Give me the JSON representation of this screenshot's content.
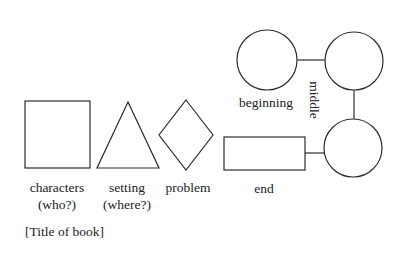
{
  "diagram": {
    "title": "[Title of book]",
    "shapes": [
      {
        "id": "characters",
        "shape": "square",
        "label_line1": "characters",
        "label_line2": "(who?)"
      },
      {
        "id": "setting",
        "shape": "triangle",
        "label_line1": "setting",
        "label_line2": "(where?)"
      },
      {
        "id": "problem",
        "shape": "diamond",
        "label_line1": "problem"
      },
      {
        "id": "end",
        "shape": "rectangle",
        "label_line1": "end"
      }
    ],
    "plot_circles": [
      {
        "id": "beginning",
        "label": "beginning"
      },
      {
        "id": "middle",
        "label": "middle"
      },
      {
        "id": "end-circle"
      }
    ],
    "colors": {
      "stroke": "#2e2e2e",
      "text": "#222222",
      "background": "#ffffff"
    }
  }
}
